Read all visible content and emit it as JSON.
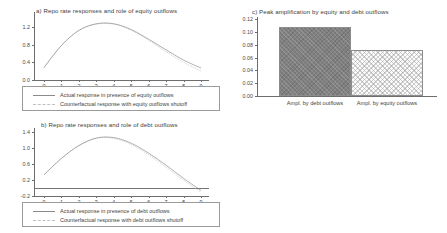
{
  "figure": {
    "panels": [
      "a",
      "b",
      "c"
    ]
  },
  "panel_a": {
    "title": "a) Repo rate responses and role of equity outflows",
    "legend": [
      {
        "label": "Actual response in presence of equity outflows",
        "style": "solid"
      },
      {
        "label": "Counterfactual response with equity outflows shutoff",
        "style": "dashed"
      }
    ]
  },
  "panel_b": {
    "title": "b)  Repo rate responses and role of debt outflows",
    "legend": [
      {
        "label": "Actual response in presence of debt outflows",
        "style": "solid"
      },
      {
        "label": "Counterfactual response with debt outflows shutoff",
        "style": "dashed"
      }
    ]
  },
  "panel_c": {
    "title": "c)  Peak  amplification by equity and debt outflows"
  },
  "chart_data": [
    {
      "type": "line",
      "panel": "a",
      "title": "a) Repo rate responses and role of equity outflows",
      "xlabel": "",
      "ylabel": "",
      "xlim": [
        0,
        9
      ],
      "ylim": [
        0.0,
        1.4
      ],
      "yticks": [
        "0.0",
        "0.4",
        "0.8",
        "1.2"
      ],
      "ytick_values": [
        0.0,
        0.4,
        0.8,
        1.2
      ],
      "xticks": [
        "0",
        "1",
        "2",
        "3",
        "4",
        "5",
        "6",
        "7",
        "8",
        "9"
      ],
      "xtick_values": [
        0,
        1,
        2,
        3,
        4,
        5,
        6,
        7,
        8,
        9
      ],
      "grid": false,
      "legend_position": "below",
      "x": [
        0,
        1,
        2,
        3,
        4,
        5,
        6,
        7,
        8,
        9
      ],
      "series": [
        {
          "name": "Actual response in presence of equity outflows",
          "style": "solid",
          "color": "#808080",
          "values": [
            0.28,
            0.78,
            1.12,
            1.27,
            1.27,
            1.14,
            0.92,
            0.68,
            0.45,
            0.27
          ]
        },
        {
          "name": "Counterfactual response with equity outflows shutoff",
          "style": "dashed",
          "color": "#b4b4b4",
          "values": [
            0.28,
            0.78,
            1.12,
            1.26,
            1.26,
            1.12,
            0.9,
            0.64,
            0.4,
            0.2
          ]
        }
      ]
    },
    {
      "type": "line",
      "panel": "b",
      "title": "b)  Repo rate responses and role of debt outflows",
      "xlabel": "",
      "ylabel": "",
      "xlim": [
        0,
        9
      ],
      "ylim": [
        -0.2,
        1.4
      ],
      "yticks": [
        "-0.2",
        "0.2",
        "0.6",
        "1.0",
        "1.4"
      ],
      "ytick_values": [
        -0.2,
        0.2,
        0.6,
        1.0,
        1.4
      ],
      "xticks": [
        "0",
        "1",
        "2",
        "3",
        "4",
        "5",
        "6",
        "7",
        "8",
        "9"
      ],
      "xtick_values": [
        0,
        1,
        2,
        3,
        4,
        5,
        6,
        7,
        8,
        9
      ],
      "grid": false,
      "zero_line": 0.0,
      "legend_position": "below",
      "x": [
        0,
        1,
        2,
        3,
        4,
        5,
        6,
        7,
        8,
        9
      ],
      "series": [
        {
          "name": "Actual response in presence of debt outflows",
          "style": "solid",
          "color": "#808080",
          "values": [
            0.33,
            0.74,
            1.06,
            1.25,
            1.26,
            1.12,
            0.87,
            0.57,
            0.24,
            -0.06
          ]
        },
        {
          "name": "Counterfactual response with debt outflows shutoff",
          "style": "dashed",
          "color": "#b4b4b4",
          "values": [
            0.33,
            0.74,
            1.06,
            1.24,
            1.24,
            1.09,
            0.83,
            0.52,
            0.19,
            -0.1
          ]
        }
      ]
    },
    {
      "type": "bar",
      "panel": "c",
      "title": "c)  Peak  amplification by equity and debt outflows",
      "xlabel": "",
      "ylabel": "",
      "ylim": [
        0.0,
        0.12
      ],
      "yticks": [
        "0.00",
        "0.02",
        "0.04",
        "0.06",
        "0.08",
        "0.10",
        "0.12"
      ],
      "ytick_values": [
        0.0,
        0.02,
        0.04,
        0.06,
        0.08,
        0.1,
        0.12
      ],
      "grid": false,
      "categories": [
        "Ampl. by debt outflows",
        "Ampl. by equity outflows"
      ],
      "values": [
        0.107,
        0.071
      ],
      "bar_styles": [
        "dark-crosshatch",
        "light-crosshatch"
      ]
    }
  ]
}
